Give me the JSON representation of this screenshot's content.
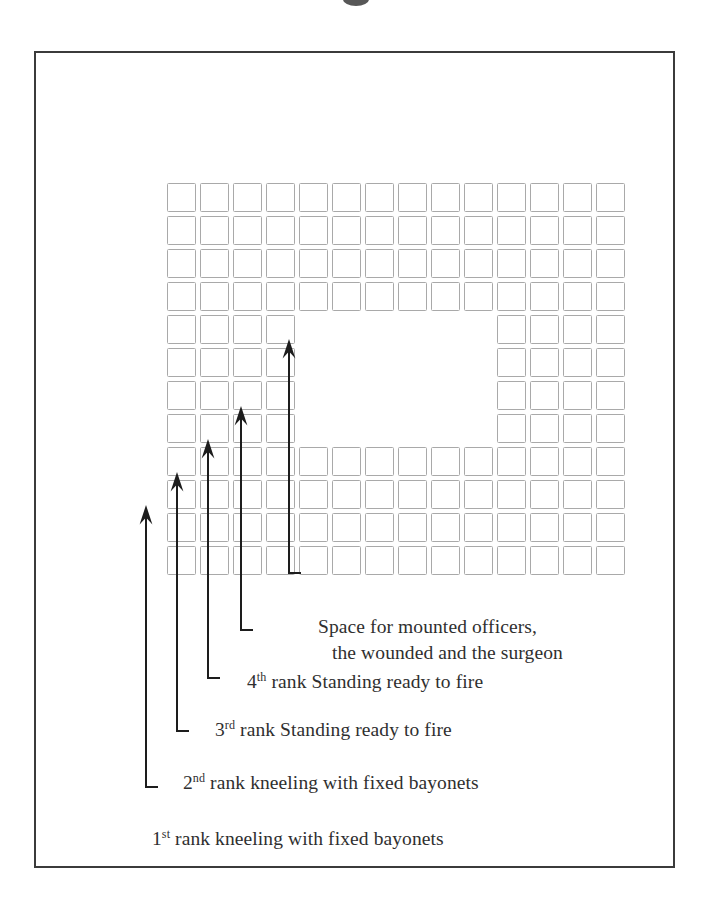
{
  "figure": {
    "frame_color": "#3b3b3b",
    "cell_border_color": "#a9a9a9",
    "ink_color": "#1d1d1d"
  },
  "grid": {
    "columns": 14,
    "rows": 12,
    "cell_size_px": 33,
    "hollow_rows": [
      5,
      6,
      7,
      8
    ],
    "hollow_left_cells": 4,
    "hollow_right_cells": 4,
    "hollow_gap_cells": 6,
    "row_layout": [
      "full",
      "full",
      "full",
      "full",
      "hollow",
      "hollow",
      "hollow",
      "hollow",
      "full",
      "full",
      "full",
      "full"
    ]
  },
  "arrows": [
    {
      "name": "arrow-rank-1",
      "x": 144,
      "tip_y": 503,
      "tail_y": 768
    },
    {
      "name": "arrow-rank-2",
      "x": 175,
      "tip_y": 470,
      "tail_y": 712
    },
    {
      "name": "arrow-rank-3",
      "x": 206,
      "tip_y": 437,
      "tail_y": 658
    },
    {
      "name": "arrow-rank-4",
      "x": 239,
      "tip_y": 404,
      "tail_y": 611
    },
    {
      "name": "arrow-center-space",
      "x": 287,
      "tip_y": 337,
      "tail_y": 562
    }
  ],
  "labels": [
    {
      "id": "space-for-mounted-officers",
      "line1": "Space for mounted officers,",
      "line2": "the wounded and the surgeon",
      "ordinal": "",
      "ordinal_suffix": ""
    },
    {
      "id": "rank-4",
      "ordinal": "4",
      "ordinal_suffix": "th",
      "line1": " rank Standing ready to fire",
      "line2": ""
    },
    {
      "id": "rank-3",
      "ordinal": "3",
      "ordinal_suffix": "rd",
      "line1": " rank Standing ready to fire",
      "line2": ""
    },
    {
      "id": "rank-2",
      "ordinal": "2",
      "ordinal_suffix": "nd",
      "line1": " rank kneeling with fixed bayonets",
      "line2": ""
    },
    {
      "id": "rank-1",
      "ordinal": "1",
      "ordinal_suffix": "st",
      "line1": " rank kneeling with fixed bayonets",
      "line2": ""
    }
  ]
}
